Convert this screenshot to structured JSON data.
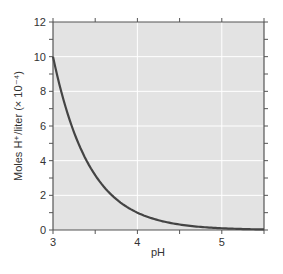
{
  "chart_data": {
    "type": "line",
    "title": "",
    "xlabel": "pH",
    "ylabel": "Moles H⁺/liter (× 10⁻⁴)",
    "xlim": [
      3,
      5.5
    ],
    "ylim": [
      0,
      12
    ],
    "x_ticks": [
      3,
      4,
      5
    ],
    "x_minor_ticks": [
      3.5,
      4.5,
      5.5
    ],
    "y_ticks": [
      0,
      2,
      4,
      6,
      8,
      10,
      12
    ],
    "y_minor_ticks": [
      1,
      3,
      5,
      7,
      9,
      11
    ],
    "grid": true,
    "legend": null,
    "series": [
      {
        "name": "H+ concentration",
        "function": "10^(4 - pH)",
        "x": [
          3.0,
          3.25,
          3.5,
          3.75,
          4.0,
          4.25,
          4.5,
          4.75,
          5.0,
          5.25,
          5.5
        ],
        "values": [
          10.0,
          5.62,
          3.16,
          1.78,
          1.0,
          0.56,
          0.32,
          0.18,
          0.1,
          0.06,
          0.03
        ]
      }
    ],
    "colors": {
      "plot_background": "#e3e3e3",
      "grid": "#ffffff",
      "line": "#444444",
      "axis": "#555555"
    }
  }
}
